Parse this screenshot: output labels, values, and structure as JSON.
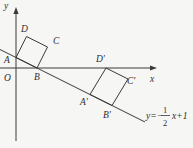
{
  "figure": {
    "axes": {
      "x_label": "x",
      "y_label": "y",
      "origin_label": "O"
    },
    "points": {
      "A": "A",
      "B": "B",
      "C": "C",
      "D": "D",
      "A_prime": "A′",
      "B_prime": "B′",
      "C_prime": "C′",
      "D_prime": "D′"
    },
    "equation": {
      "full_text": "y=−1/2x+1",
      "prefix": "y=−",
      "numerator": "1",
      "denominator": "2",
      "suffix": "x+1"
    },
    "colors": {
      "ink": "#3a3a3a",
      "background": "#f6f6f4"
    }
  }
}
